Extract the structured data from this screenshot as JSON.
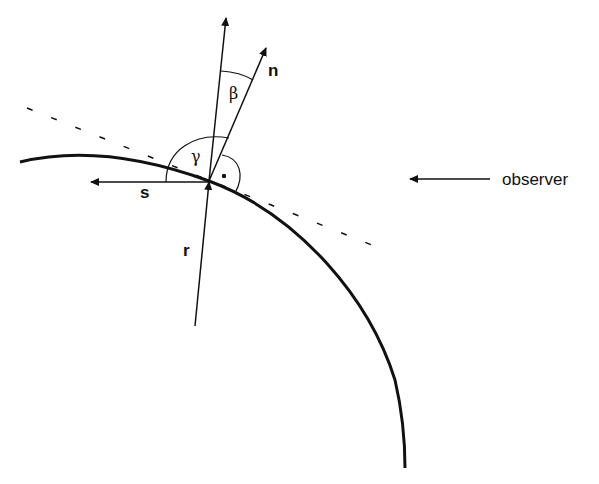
{
  "diagram": {
    "type": "geometry-illustration",
    "labels": {
      "normal": "n",
      "radius": "r",
      "surface_direction": "s",
      "observer": "observer",
      "angle_beta": "β",
      "angle_gamma": "γ",
      "right_angle_mark": "·"
    },
    "colors": {
      "stroke": "#111111",
      "background": "#ffffff"
    }
  }
}
